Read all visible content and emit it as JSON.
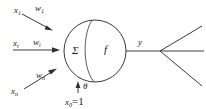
{
  "diagram": {
    "colors": {
      "stroke": "#3a3a3a",
      "text": "#1c1c1c",
      "background": "#ffffff"
    },
    "inputs": [
      {
        "signal": "x",
        "signal_sub": "1",
        "weight": "w",
        "weight_sub": "1"
      },
      {
        "signal": "x",
        "signal_sub": "i",
        "weight": "w",
        "weight_sub": "i"
      },
      {
        "signal": "x",
        "signal_sub": "n",
        "weight": "w",
        "weight_sub": "n"
      }
    ],
    "body": {
      "sum_symbol": "Σ",
      "activation_symbol": "f"
    },
    "bias": {
      "theta_symbol": "θ",
      "bias_input": "x",
      "bias_input_sub": "0",
      "bias_equals": "=1"
    },
    "output": {
      "label": "y"
    },
    "fanout_branches": 3
  }
}
